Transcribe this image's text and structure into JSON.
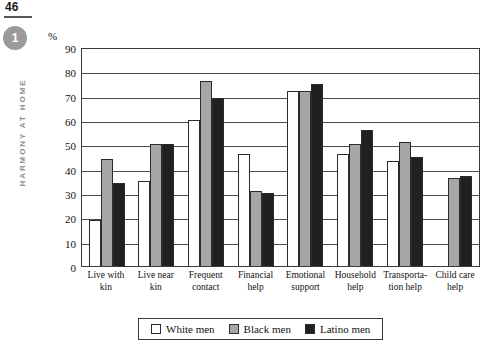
{
  "page": {
    "number": "46",
    "chapter_badge": "1",
    "running_head": "HARMONY AT HOME"
  },
  "legend": {
    "position": "bottom",
    "items": [
      {
        "label": "White men",
        "swatch": "white-swatch",
        "color": "#ffffff"
      },
      {
        "label": "Black men",
        "swatch": "gray-swatch",
        "color": "#a6a6a6"
      },
      {
        "label": "Latino men",
        "swatch": "black-swatch",
        "color": "#231f1c"
      }
    ]
  },
  "chart_data": {
    "type": "bar",
    "title": "",
    "xlabel": "",
    "ylabel": "%",
    "ylim": [
      0,
      90
    ],
    "yticks": [
      0,
      10,
      20,
      30,
      40,
      50,
      60,
      70,
      80,
      90
    ],
    "grid": true,
    "categories": [
      "Live with kin",
      "Live near kin",
      "Frequent contact",
      "Financial help",
      "Emotional support",
      "Household help",
      "Transporta- tion help",
      "Child care help"
    ],
    "category_lines": [
      [
        "Live with",
        "kin"
      ],
      [
        "Live near",
        "kin"
      ],
      [
        "Frequent",
        "contact"
      ],
      [
        "Financial",
        "help"
      ],
      [
        "Emotional",
        "support"
      ],
      [
        "Household",
        "help"
      ],
      [
        "Transporta-",
        "tion help"
      ],
      [
        "Child care",
        "help"
      ]
    ],
    "series": [
      {
        "name": "White men",
        "color": "#ffffff",
        "values": [
          19,
          35,
          60,
          46,
          72,
          46,
          43,
          null
        ]
      },
      {
        "name": "Black men",
        "color": "#a6a6a6",
        "values": [
          44,
          50,
          76,
          31,
          72,
          50,
          51,
          36
        ]
      },
      {
        "name": "Latino men",
        "color": "#231f1c",
        "values": [
          34,
          50,
          69,
          30,
          75,
          56,
          45,
          37
        ]
      }
    ]
  }
}
